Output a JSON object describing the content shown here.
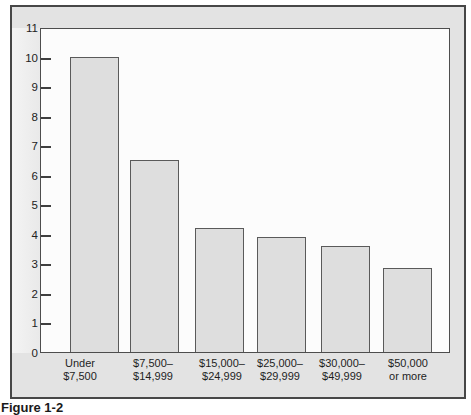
{
  "chart_data": {
    "type": "bar",
    "categories": [
      "Under $7,500",
      "$7,500–$14,999",
      "$15,000–$24,999",
      "$25,000–$29,999",
      "$30,000–$49,999",
      "$50,000 or more"
    ],
    "categories_lines": [
      [
        "Under",
        "$7,500"
      ],
      [
        "$7,500–",
        "$14,999"
      ],
      [
        "$15,000–",
        "$24,999"
      ],
      [
        "$25,000–",
        "$29,999"
      ],
      [
        "$30,000–",
        "$49,999"
      ],
      [
        "$50,000",
        "or more"
      ]
    ],
    "values": [
      10,
      6.5,
      4.2,
      3.9,
      3.6,
      2.85
    ],
    "title": "",
    "xlabel": "",
    "ylabel": "",
    "ylim": [
      0,
      11
    ],
    "yticks": [
      0,
      1,
      2,
      3,
      4,
      5,
      6,
      7,
      8,
      9,
      10,
      11
    ],
    "grid": false,
    "legend": "none",
    "bar_fill": "#dedede",
    "bar_border": "#5a5a5a"
  },
  "caption": {
    "fragment": "Figure 1-2"
  },
  "colors": {
    "figure_background": "#e3e3e3",
    "plot_background": "#fcfcfc",
    "outer_border": "#474747",
    "plot_frame": "#4d4d4d",
    "tick": "#3f3f3f",
    "text": "#1e1e1e"
  }
}
